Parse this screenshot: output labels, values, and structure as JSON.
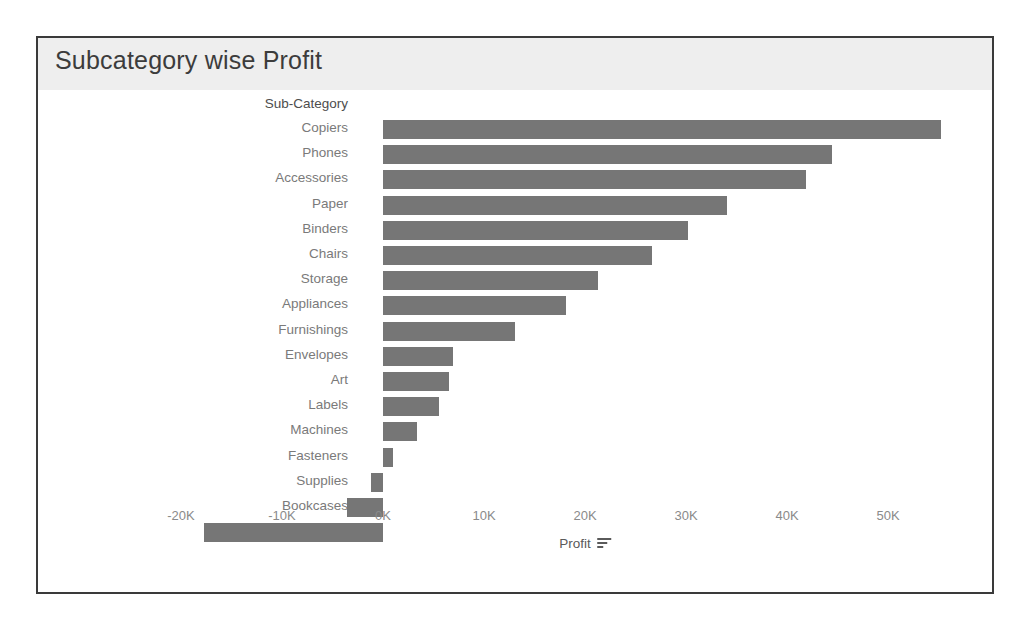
{
  "card": {
    "title": "Subcategory wise Profit"
  },
  "axes": {
    "category_header": "Sub-Category",
    "x_axis_title": "Profit",
    "sort_icon": "sort-descending-icon"
  },
  "colors": {
    "bar": "#767676",
    "title_band": "#eeeeee",
    "border": "#3a3a3a",
    "category_label": "#7a7a7a",
    "tick_label": "#8a8a8a"
  },
  "chart_data": {
    "type": "bar",
    "orientation": "horizontal",
    "title": "Subcategory wise Profit",
    "xlabel": "Profit",
    "ylabel": "Sub-Category",
    "xlim": [
      -22000,
      57000
    ],
    "grid": false,
    "legend": null,
    "tick_labels": [
      "-20K",
      "-10K",
      "0K",
      "10K",
      "20K",
      "30K",
      "40K",
      "50K"
    ],
    "tick_values": [
      -20000,
      -10000,
      0,
      10000,
      20000,
      30000,
      40000,
      50000
    ],
    "categories": [
      "Copiers",
      "Phones",
      "Accessories",
      "Paper",
      "Binders",
      "Chairs",
      "Storage",
      "Appliances",
      "Furnishings",
      "Envelopes",
      "Art",
      "Labels",
      "Machines",
      "Fasteners",
      "Supplies",
      "Bookcases",
      "Tables"
    ],
    "values": [
      55200,
      44500,
      41900,
      34100,
      30200,
      26600,
      21300,
      18100,
      13100,
      6900,
      6500,
      5500,
      3400,
      950,
      -1200,
      -3600,
      -17700
    ]
  }
}
